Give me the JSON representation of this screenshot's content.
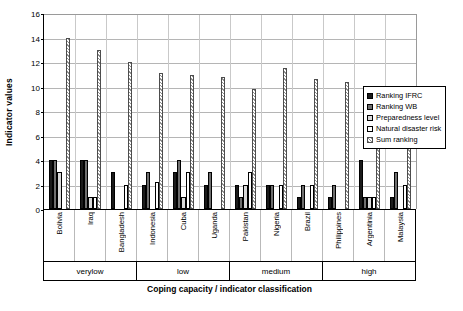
{
  "chart_data": {
    "type": "bar",
    "title": "",
    "xlabel": "Coping capacity / indicator classification",
    "ylabel": "Indicator values",
    "ylim": [
      0,
      16
    ],
    "yticks": [
      0,
      2,
      4,
      6,
      8,
      10,
      12,
      14,
      16
    ],
    "grid": true,
    "legend_position": "inside-top-right",
    "categories": [
      "Bolivia",
      "Iraq",
      "Bangladesh",
      "Indonesia",
      "Cuba",
      "Uganda",
      "Pakistan",
      "Nigeria",
      "Brazil",
      "Philippines",
      "Argentinia",
      "Malaysia"
    ],
    "groups": [
      {
        "label": "verylow",
        "span": 3
      },
      {
        "label": "low",
        "span": 3
      },
      {
        "label": "medium",
        "span": 3
      },
      {
        "label": "high",
        "span": 3
      }
    ],
    "series": [
      {
        "name": "Ranking IFRC",
        "values": [
          4,
          4,
          3,
          2,
          3,
          2,
          2,
          2,
          1,
          1,
          4,
          1
        ]
      },
      {
        "name": "Ranking WB",
        "values": [
          4,
          4,
          0,
          3,
          4,
          3,
          1,
          2,
          2,
          2,
          1,
          3
        ]
      },
      {
        "name": "Preparedness level",
        "values": [
          3,
          1,
          0,
          0,
          1,
          0,
          2,
          0,
          0,
          0,
          1,
          0
        ]
      },
      {
        "name": "Natural disaster risk",
        "values": [
          0,
          1,
          2,
          2.2,
          3,
          0,
          3,
          2,
          2,
          0,
          1,
          2
        ]
      },
      {
        "name": "Sum ranking",
        "values": [
          14,
          13,
          12,
          11.1,
          10.9,
          10.8,
          9.8,
          11.5,
          10.6,
          10.4,
          8,
          7.8
        ]
      }
    ]
  },
  "legend": {
    "items": [
      {
        "label": "Ranking IFRC"
      },
      {
        "label": "Ranking WB"
      },
      {
        "label": "Preparedness level"
      },
      {
        "label": "Natural disaster risk"
      },
      {
        "label": "Sum ranking"
      }
    ]
  }
}
